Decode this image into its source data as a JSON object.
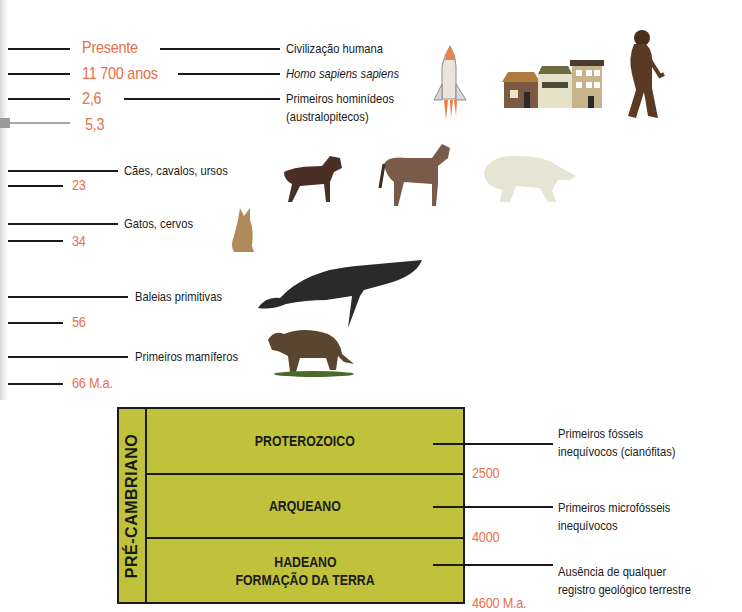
{
  "cenozoic_timeline": {
    "ages": [
      {
        "label": "Presente",
        "y": 48
      },
      {
        "label": "11 700 anos",
        "y": 74
      },
      {
        "label": "2,6",
        "y": 99
      },
      {
        "label": "5,3",
        "y": 124
      },
      {
        "label": "23",
        "y": 185
      },
      {
        "label": "34",
        "y": 241
      },
      {
        "label": "56",
        "y": 322
      },
      {
        "label": "66 M.a.",
        "y": 383
      }
    ],
    "events": [
      {
        "label": "Civilização humana"
      },
      {
        "label": "Homo sapiens sapiens",
        "italic": true
      },
      {
        "label": "Primeiros hominídeos",
        "label_line2": "(australopitecos)"
      },
      {
        "label": "Cães, cavalos, ursos"
      },
      {
        "label": "Gatos, cervos"
      },
      {
        "label": "Baleias primitivas"
      },
      {
        "label": "Primeiros mamíferos"
      }
    ],
    "illustrations": [
      "space-shuttle",
      "houses",
      "hominid",
      "dog",
      "horse",
      "polar-bear",
      "cat",
      "whale",
      "early-mammal"
    ]
  },
  "precambrian": {
    "title": "PRÉ-CAMBRIANO",
    "fill_color": "#bfc23a",
    "eons": [
      {
        "name": "PROTEROZOICO",
        "name_line2": "",
        "event": "Primeiros fósseis",
        "event_line2": "inequívocos (cianófitas)",
        "boundary_age": "2500"
      },
      {
        "name": "ARQUEANO",
        "name_line2": "",
        "event": "Primeiros microfósseis",
        "event_line2": "inequívocos",
        "boundary_age": "4000"
      },
      {
        "name": "HADEANO",
        "name_line2": "FORMAÇÃO DA TERRA",
        "event": "Ausência de qualquer",
        "event_line2": "registro geológico terrestre",
        "boundary_age": "4600 M.a."
      }
    ]
  },
  "colors": {
    "age_text": "#e8704a",
    "line": "#1a1a1a"
  }
}
